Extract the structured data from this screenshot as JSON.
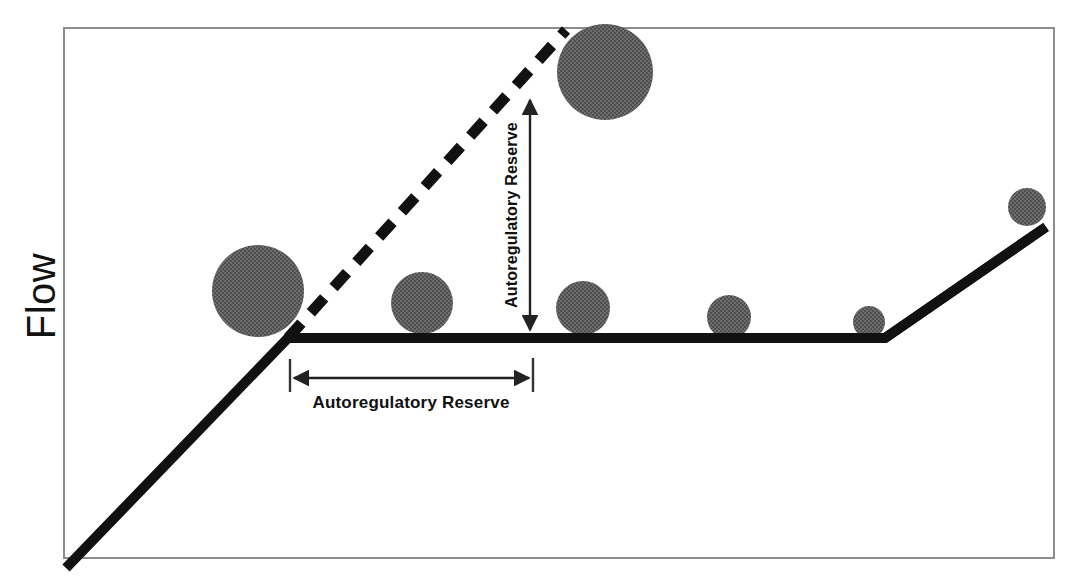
{
  "figure": {
    "kind": "line-diagram",
    "background_color": "#ffffff",
    "frame": {
      "color": "#8a8a8a",
      "x": 64,
      "y": 28,
      "width": 990,
      "height": 530
    }
  },
  "axes": {
    "y_label": "Flow",
    "y_label_color": "#111111",
    "x_label": ""
  },
  "annotations": {
    "horizontal": {
      "label": "Autoregulatory Reserve",
      "arrow_style": "double-headed",
      "orientation": "horizontal",
      "start_x": 292,
      "end_x": 530,
      "y": 378,
      "tick_color": "#333333"
    },
    "vertical": {
      "label": "Autoregulatory Reserve",
      "arrow_style": "double-headed",
      "orientation": "vertical-rotated-90",
      "x": 530,
      "top_y": 98,
      "bottom_y": 332
    }
  },
  "curves": {
    "solid": {
      "name": "measured-flow-curve",
      "color": "#111111",
      "stroke_width": 10,
      "points": "66,568 288,338 885,338 1046,227",
      "description": "rising limb, autoregulatory plateau, then rising limb"
    },
    "dashed": {
      "name": "ideal-flow-curve",
      "color": "#111111",
      "stroke_width": 11,
      "dash_pattern": "20 14",
      "points": "288,338 566,30",
      "description": "extrapolated linear pressure-flow relationship"
    }
  },
  "markers": {
    "fill_color": "#555555",
    "pattern": "checkerboard-halftone",
    "vessels": [
      {
        "name": "vessel-1",
        "cx": 258,
        "cy": 291,
        "r": 46
      },
      {
        "name": "vessel-2",
        "cx": 422,
        "cy": 303,
        "r": 31
      },
      {
        "name": "vessel-3",
        "cx": 605,
        "cy": 72,
        "r": 48
      },
      {
        "name": "vessel-4",
        "cx": 583,
        "cy": 308,
        "r": 27
      },
      {
        "name": "vessel-5",
        "cx": 729,
        "cy": 317,
        "r": 22
      },
      {
        "name": "vessel-6",
        "cx": 869,
        "cy": 322,
        "r": 16
      },
      {
        "name": "vessel-7",
        "cx": 1027,
        "cy": 207,
        "r": 19
      }
    ]
  }
}
